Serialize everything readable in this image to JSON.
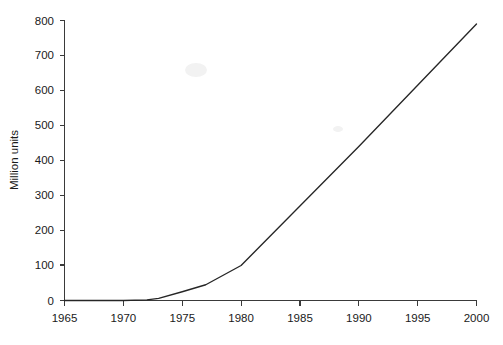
{
  "chart_data": {
    "type": "line",
    "title": "",
    "subtitle": "",
    "xlabel": "",
    "ylabel": "Million units",
    "xlim": [
      1965,
      2000
    ],
    "ylim": [
      0,
      800
    ],
    "grid": false,
    "legend": false,
    "legend_position": "none",
    "x_ticks": [
      1965,
      1970,
      1975,
      1980,
      1985,
      1990,
      1995,
      2000
    ],
    "y_ticks": [
      0,
      100,
      200,
      300,
      400,
      500,
      600,
      700,
      800
    ],
    "series": [
      {
        "name": "Million units",
        "color": "#262626",
        "x": [
          1965,
          1970,
          1972,
          1973,
          1975,
          1977,
          1980,
          1985,
          1990,
          1995,
          2000
        ],
        "values": [
          0,
          0,
          2,
          6,
          25,
          45,
          100,
          270,
          440,
          615,
          790
        ]
      }
    ]
  },
  "axes": {
    "y_title": "Million units",
    "y_tick_labels": [
      "800",
      "700",
      "600",
      "500",
      "400",
      "300",
      "200",
      "100",
      "0"
    ],
    "x_tick_labels": [
      "1965",
      "1970",
      "1975",
      "1980",
      "1985",
      "1990",
      "1995",
      "2000"
    ]
  }
}
